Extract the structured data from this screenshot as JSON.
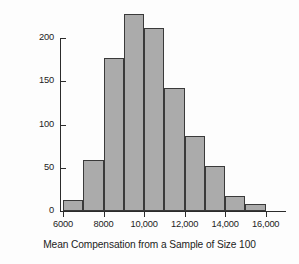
{
  "chart_data": {
    "type": "bar",
    "title": "",
    "subtitle": "",
    "xlabel": "Mean Compensation from a Sample of Size 100",
    "ylabel": "Number of CEOs",
    "categories": [
      "6000-7000",
      "7000-8000",
      "8000-9000",
      "9000-10,000",
      "10,000-11,000",
      "11,000-12,000",
      "12,000-13,000",
      "13,000-14,000",
      "14,000-15,000",
      "15,000-16,000"
    ],
    "bin_edges": [
      6000,
      7000,
      8000,
      9000,
      10000,
      11000,
      12000,
      13000,
      14000,
      15000,
      16000
    ],
    "values": [
      13,
      59,
      177,
      228,
      211,
      142,
      87,
      52,
      17,
      8
    ],
    "xlim": [
      6000,
      17000
    ],
    "ylim": [
      0,
      232
    ],
    "xticks": [
      6000,
      8000,
      10000,
      12000,
      14000,
      16000
    ],
    "xtick_labels": [
      "6000",
      "8000",
      "10,000",
      "12,000",
      "14,000",
      "16,000"
    ],
    "yticks": [
      0,
      50,
      100,
      150,
      200
    ],
    "ytick_labels": [
      "0",
      "50",
      "100",
      "150",
      "200"
    ],
    "grid": false,
    "legend": null,
    "bar_fill_color": "#ababab",
    "bar_edge_color": "#3a3a3a",
    "axis_color": "#2b2b2b",
    "background_color": "#fdfdfd"
  }
}
